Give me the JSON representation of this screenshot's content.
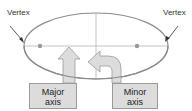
{
  "diagram": {
    "labels": {
      "vertex_left": "Vertex",
      "vertex_right": "Vertex",
      "major_axis_line1": "Major",
      "major_axis_line2": "axis",
      "minor_axis_line1": "Minor",
      "minor_axis_line2": "axis"
    },
    "shapes": {
      "ellipse": {
        "cx": 96,
        "cy": 46,
        "rx": 72,
        "ry": 33
      },
      "foci": [
        {
          "x": 40,
          "y": 46
        },
        {
          "x": 137,
          "y": 46
        }
      ],
      "vertices": [
        {
          "x": 24,
          "y": 46
        },
        {
          "x": 168,
          "y": 46
        }
      ]
    },
    "colors": {
      "ellipse_stroke": "#8c8c8c",
      "axis_line": "#b4b4b4",
      "focus_dot": "#999999",
      "arrow_fill": "#dcdcdc",
      "arrow_stroke": "#9a9a9a",
      "pointer": "#333333"
    }
  }
}
